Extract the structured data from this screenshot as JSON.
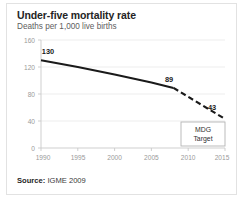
{
  "card": {
    "title": "Under-five mortality rate",
    "subtitle": "Deaths per 1,000 live births",
    "source_label": "Source:",
    "source_value": "IGME 2009"
  },
  "chart_data": {
    "type": "line",
    "title": "Under-five mortality rate",
    "subtitle": "Deaths per 1,000 live births",
    "xlabel": "",
    "ylabel": "",
    "xlim": [
      1990,
      2015
    ],
    "ylim": [
      0,
      160
    ],
    "grid": true,
    "legend": "none",
    "x_ticks": [
      "1990",
      "1995",
      "2000",
      "2005",
      "2010",
      "2015"
    ],
    "x_tick_values": [
      1990,
      1995,
      2000,
      2005,
      2010,
      2015
    ],
    "y_ticks": [
      "0",
      "40",
      "80",
      "120",
      "160"
    ],
    "y_tick_values": [
      0,
      40,
      80,
      120,
      160
    ],
    "series": [
      {
        "name": "observed",
        "style": "solid",
        "color": "#1a1a1a",
        "x": [
          1990,
          1995,
          2000,
          2005,
          2008
        ],
        "values": [
          130,
          120,
          109,
          97,
          89
        ]
      },
      {
        "name": "projected",
        "style": "dashed",
        "color": "#1a1a1a",
        "x": [
          2008,
          2015
        ],
        "values": [
          89,
          43
        ]
      }
    ],
    "annotations": [
      {
        "name": "label-130",
        "text": "130",
        "x": 1990,
        "y": 130
      },
      {
        "name": "label-89",
        "text": "89",
        "x": 2008,
        "y": 89
      },
      {
        "name": "label-43",
        "text": "43",
        "x": 2015,
        "y": 43
      },
      {
        "name": "mdg-target-box",
        "text_line1": "MDG",
        "text_line2": "Target",
        "x": 2014,
        "y": 22
      }
    ]
  }
}
